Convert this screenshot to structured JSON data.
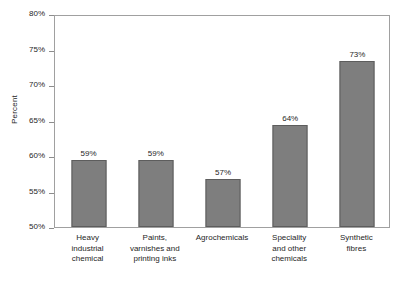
{
  "chart_data": {
    "type": "bar",
    "title": "",
    "subtitle": "",
    "xlabel": "",
    "ylabel": "Percent",
    "ylim": [
      50,
      80
    ],
    "ytick_step": 5,
    "ytick_labels": [
      "80%",
      "75%",
      "70%",
      "65%",
      "60%",
      "55%",
      "50%"
    ],
    "ytick_values": [
      80,
      75,
      70,
      65,
      60,
      55,
      50
    ],
    "grid": false,
    "legend": null,
    "value_label_suffix": "%",
    "categories": [
      "Heavy industrial chemical",
      "Paints, varnishes and printing inks",
      "Agrochemicals",
      "Speciality and other chemicals",
      "Synthetic fibres"
    ],
    "values": [
      59.5,
      59.5,
      56.8,
      64.3,
      73.4
    ],
    "value_labels": [
      "59%",
      "57%",
      "64%",
      "73%"
    ],
    "bars": [
      {
        "category_lines": [
          "Heavy",
          "industrial",
          "chemical"
        ],
        "category": "Heavy industrial chemical",
        "value": 59.5,
        "label": "59%"
      },
      {
        "category_lines": [
          "Paints,",
          "varnishes and",
          "printing inks"
        ],
        "category": "Paints, varnishes and printing inks",
        "value": 59.5,
        "label": "59%"
      },
      {
        "category_lines": [
          "Agrochemicals"
        ],
        "category": "Agrochemicals",
        "value": 56.8,
        "label": "57%"
      },
      {
        "category_lines": [
          "Speciality",
          "and other",
          "chemicals"
        ],
        "category": "Speciality and other chemicals",
        "value": 64.3,
        "label": "64%"
      },
      {
        "category_lines": [
          "Synthetic",
          "fibres"
        ],
        "category": "Synthetic fibres",
        "value": 73.4,
        "label": "73%"
      }
    ],
    "colors": {
      "bar_fill": "#7e7e7e",
      "bar_border": "#5d5d5d",
      "axis": "#a0a0a0",
      "tick": "#8c8c8c",
      "text": "#262626",
      "background": "#ffffff"
    }
  }
}
